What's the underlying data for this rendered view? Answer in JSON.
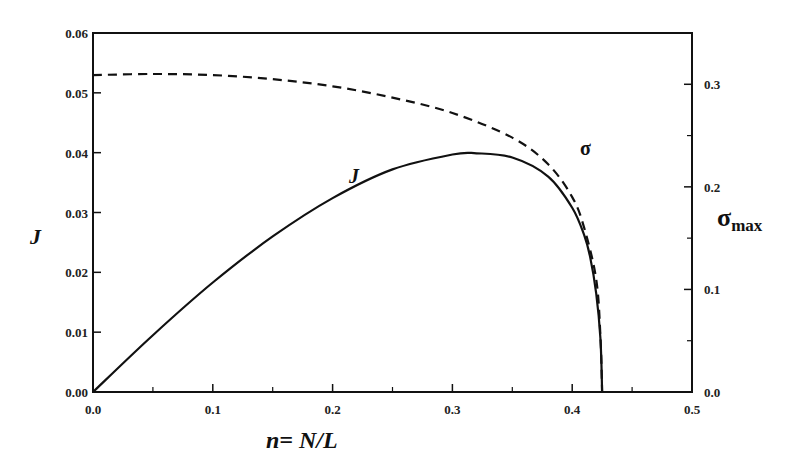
{
  "chart_data": {
    "type": "line",
    "title": "",
    "xlabel": "n= N/L",
    "ylabel": "J",
    "y2label": "σ_max",
    "xlim": [
      0.0,
      0.5
    ],
    "ylim": [
      0.0,
      0.06
    ],
    "y2lim": [
      0.0,
      0.35
    ],
    "grid": false,
    "legend": "inline curve labels",
    "x_ticks": [
      "0.0",
      "0.1",
      "0.2",
      "0.3",
      "0.4",
      "0.5"
    ],
    "y_ticks": [
      "0.00",
      "0.01",
      "0.02",
      "0.03",
      "0.04",
      "0.05",
      "0.06"
    ],
    "y2_ticks": [
      "0.0",
      "0.1",
      "0.2",
      "0.3"
    ],
    "series": [
      {
        "name": "J",
        "axis": "left",
        "style": "solid",
        "x": [
          0.0,
          0.05,
          0.1,
          0.15,
          0.2,
          0.25,
          0.3,
          0.32,
          0.35,
          0.38,
          0.4,
          0.41,
          0.415,
          0.42,
          0.4235,
          0.425
        ],
        "values": [
          0.0,
          0.0095,
          0.0183,
          0.026,
          0.0324,
          0.0372,
          0.0397,
          0.0399,
          0.0392,
          0.036,
          0.0308,
          0.0262,
          0.0225,
          0.0165,
          0.009,
          0.0
        ]
      },
      {
        "name": "σ",
        "axis": "right",
        "style": "dashed",
        "x": [
          0.0,
          0.05,
          0.1,
          0.15,
          0.2,
          0.25,
          0.3,
          0.35,
          0.38,
          0.4,
          0.41,
          0.42,
          0.4235,
          0.425
        ],
        "values": [
          0.309,
          0.31,
          0.309,
          0.305,
          0.298,
          0.287,
          0.272,
          0.248,
          0.222,
          0.19,
          0.16,
          0.11,
          0.055,
          0.0
        ]
      }
    ],
    "annotations": [
      {
        "text": "J",
        "x": 0.215,
        "y": 0.0365
      },
      {
        "text": "σ",
        "x": 0.4,
        "y": 0.24
      }
    ]
  },
  "labels": {
    "xlabel": "n= N/L",
    "ylabel": "J",
    "y2label_main": "σ",
    "y2label_sub": "max",
    "curve_J": "J",
    "curve_sigma": "σ"
  }
}
